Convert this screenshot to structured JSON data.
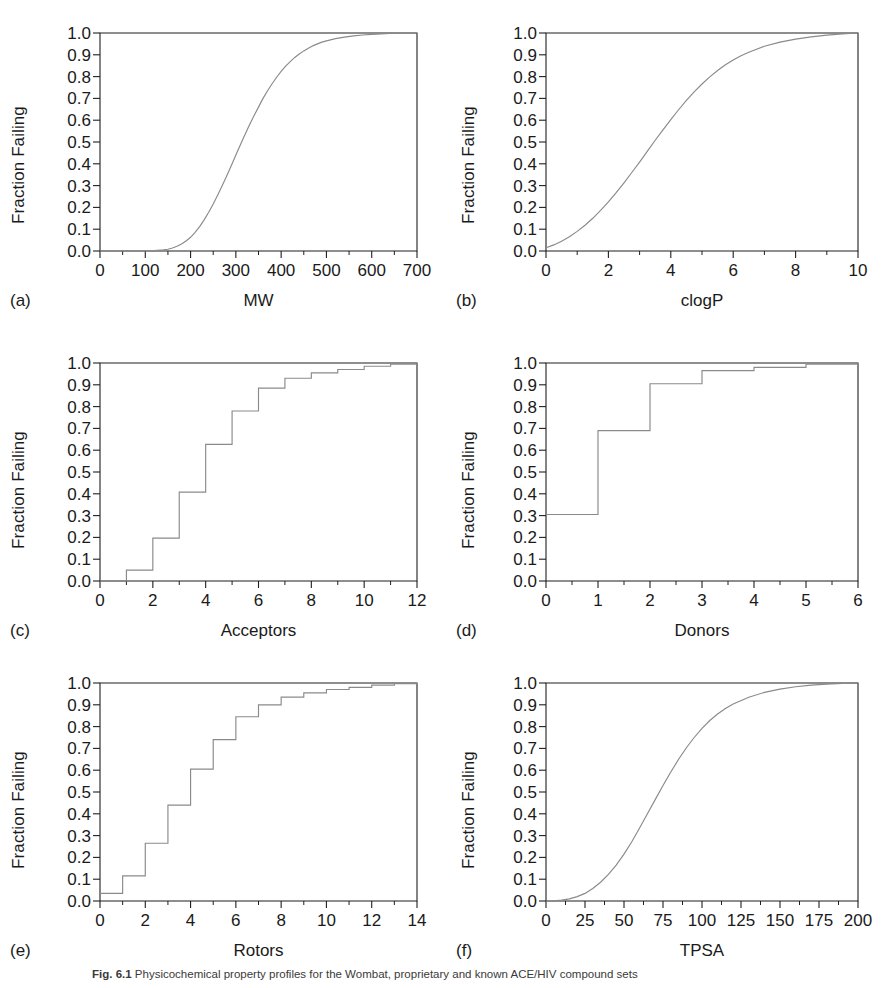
{
  "figure": {
    "ylabel": "Fraction Failing",
    "yticks": [
      "0.0",
      "0.1",
      "0.2",
      "0.3",
      "0.4",
      "0.5",
      "0.6",
      "0.7",
      "0.8",
      "0.9",
      "1.0"
    ],
    "caption_label": "Fig. 6.1",
    "caption_text": "Physicochemical property profiles for the Wombat, proprietary and known ACE/HIV compound sets"
  },
  "chart_data": [
    {
      "type": "line",
      "panel": "a",
      "panel_label": "(a)",
      "title": "",
      "xlabel": "MW",
      "ylabel": "Fraction Failing",
      "xlim": [
        0,
        700
      ],
      "ylim": [
        0,
        1
      ],
      "xticks": [
        0,
        100,
        200,
        300,
        400,
        500,
        600,
        700
      ],
      "xticklabels": [
        "0",
        "100",
        "200",
        "300",
        "400",
        "500",
        "600",
        "700"
      ],
      "yticks": [
        0.0,
        0.1,
        0.2,
        0.3,
        0.4,
        0.5,
        0.6,
        0.7,
        0.8,
        0.9,
        1.0
      ],
      "minor_x_step": 50,
      "grid": false,
      "legend": "none",
      "x": [
        0,
        20,
        40,
        60,
        80,
        100,
        120,
        140,
        150,
        160,
        170,
        180,
        190,
        200,
        210,
        220,
        230,
        240,
        250,
        260,
        270,
        280,
        290,
        300,
        310,
        320,
        330,
        340,
        350,
        360,
        370,
        380,
        390,
        400,
        410,
        420,
        430,
        440,
        450,
        460,
        470,
        480,
        490,
        500,
        520,
        540,
        560,
        580,
        600,
        620,
        640,
        660,
        680,
        700
      ],
      "values": [
        0.0,
        0.0,
        0.0,
        0.0,
        0.0,
        0.0,
        0.002,
        0.005,
        0.008,
        0.014,
        0.022,
        0.032,
        0.046,
        0.063,
        0.085,
        0.112,
        0.143,
        0.178,
        0.216,
        0.257,
        0.3,
        0.345,
        0.392,
        0.44,
        0.487,
        0.533,
        0.578,
        0.62,
        0.66,
        0.7,
        0.735,
        0.767,
        0.797,
        0.824,
        0.848,
        0.869,
        0.888,
        0.904,
        0.918,
        0.93,
        0.941,
        0.95,
        0.958,
        0.964,
        0.974,
        0.981,
        0.987,
        0.991,
        0.994,
        0.996,
        0.998,
        0.999,
        1.0,
        1.0
      ]
    },
    {
      "type": "line",
      "panel": "b",
      "panel_label": "(b)",
      "title": "",
      "xlabel": "clogP",
      "ylabel": "Fraction Failing",
      "xlim": [
        0,
        10
      ],
      "ylim": [
        0,
        1
      ],
      "xticks": [
        0,
        2,
        4,
        6,
        8,
        10
      ],
      "xticklabels": [
        "0",
        "2",
        "4",
        "6",
        "8",
        "10"
      ],
      "yticks": [
        0.0,
        0.1,
        0.2,
        0.3,
        0.4,
        0.5,
        0.6,
        0.7,
        0.8,
        0.9,
        1.0
      ],
      "minor_x_step": 1,
      "grid": false,
      "legend": "none",
      "x": [
        0,
        0.25,
        0.5,
        0.75,
        1.0,
        1.25,
        1.5,
        1.75,
        2.0,
        2.25,
        2.5,
        2.75,
        3.0,
        3.25,
        3.5,
        3.75,
        4.0,
        4.25,
        4.5,
        4.75,
        5.0,
        5.25,
        5.5,
        5.75,
        6.0,
        6.25,
        6.5,
        7.0,
        7.5,
        8.0,
        8.5,
        9.0,
        9.5,
        10.0
      ],
      "values": [
        0.015,
        0.028,
        0.045,
        0.065,
        0.09,
        0.118,
        0.15,
        0.186,
        0.225,
        0.268,
        0.313,
        0.36,
        0.408,
        0.458,
        0.508,
        0.556,
        0.603,
        0.648,
        0.691,
        0.73,
        0.766,
        0.799,
        0.828,
        0.854,
        0.876,
        0.896,
        0.912,
        0.939,
        0.958,
        0.972,
        0.982,
        0.99,
        0.996,
        1.0
      ]
    },
    {
      "type": "line",
      "panel": "c",
      "panel_label": "(c)",
      "title": "",
      "xlabel": "Acceptors",
      "ylabel": "Fraction Failing",
      "xlim": [
        0,
        12
      ],
      "ylim": [
        0,
        1
      ],
      "xticks": [
        0,
        2,
        4,
        6,
        8,
        10,
        12
      ],
      "xticklabels": [
        "0",
        "2",
        "4",
        "6",
        "8",
        "10",
        "12"
      ],
      "yticks": [
        0.0,
        0.1,
        0.2,
        0.3,
        0.4,
        0.5,
        0.6,
        0.7,
        0.8,
        0.9,
        1.0
      ],
      "minor_x_step": 1,
      "grid": false,
      "legend": "none",
      "step": true,
      "x": [
        0,
        1,
        2,
        3,
        4,
        5,
        6,
        7,
        8,
        9,
        10,
        11,
        12
      ],
      "values": [
        0.0,
        0.05,
        0.197,
        0.408,
        0.627,
        0.78,
        0.885,
        0.93,
        0.955,
        0.97,
        0.985,
        0.995,
        1.0
      ]
    },
    {
      "type": "line",
      "panel": "d",
      "panel_label": "(d)",
      "title": "",
      "xlabel": "Donors",
      "ylabel": "Fraction Failing",
      "xlim": [
        0,
        6
      ],
      "ylim": [
        0,
        1
      ],
      "xticks": [
        0,
        1,
        2,
        3,
        4,
        5,
        6
      ],
      "xticklabels": [
        "0",
        "1",
        "2",
        "3",
        "4",
        "5",
        "6"
      ],
      "yticks": [
        0.0,
        0.1,
        0.2,
        0.3,
        0.4,
        0.5,
        0.6,
        0.7,
        0.8,
        0.9,
        1.0
      ],
      "minor_x_step": 0.5,
      "grid": false,
      "legend": "none",
      "step": true,
      "x": [
        0,
        1,
        2,
        3,
        4,
        5,
        6
      ],
      "values": [
        0.305,
        0.69,
        0.905,
        0.965,
        0.98,
        0.995,
        1.0
      ]
    },
    {
      "type": "line",
      "panel": "e",
      "panel_label": "(e)",
      "title": "",
      "xlabel": "Rotors",
      "ylabel": "Fraction Failing",
      "xlim": [
        0,
        14
      ],
      "ylim": [
        0,
        1
      ],
      "xticks": [
        0,
        2,
        4,
        6,
        8,
        10,
        12,
        14
      ],
      "xticklabels": [
        "0",
        "2",
        "4",
        "6",
        "8",
        "10",
        "12",
        "14"
      ],
      "yticks": [
        0.0,
        0.1,
        0.2,
        0.3,
        0.4,
        0.5,
        0.6,
        0.7,
        0.8,
        0.9,
        1.0
      ],
      "minor_x_step": 1,
      "grid": false,
      "legend": "none",
      "step": true,
      "x": [
        0,
        1,
        2,
        3,
        4,
        5,
        6,
        7,
        8,
        9,
        10,
        11,
        12,
        13,
        14
      ],
      "values": [
        0.035,
        0.115,
        0.265,
        0.44,
        0.605,
        0.74,
        0.845,
        0.9,
        0.935,
        0.955,
        0.97,
        0.98,
        0.99,
        0.997,
        1.0
      ]
    },
    {
      "type": "line",
      "panel": "f",
      "panel_label": "(f)",
      "title": "",
      "xlabel": "TPSA",
      "ylabel": "Fraction Failing",
      "xlim": [
        0,
        200
      ],
      "ylim": [
        0,
        1
      ],
      "xticks": [
        0,
        25,
        50,
        75,
        100,
        125,
        150,
        175,
        200
      ],
      "xticklabels": [
        "0",
        "25",
        "50",
        "75",
        "100",
        "125",
        "150",
        "175",
        "200"
      ],
      "yticks": [
        0.0,
        0.1,
        0.2,
        0.3,
        0.4,
        0.5,
        0.6,
        0.7,
        0.8,
        0.9,
        1.0
      ],
      "minor_x_step": 12.5,
      "grid": false,
      "legend": "none",
      "x": [
        0,
        5,
        10,
        15,
        20,
        25,
        30,
        35,
        40,
        45,
        50,
        55,
        60,
        65,
        70,
        75,
        80,
        85,
        90,
        95,
        100,
        105,
        110,
        115,
        120,
        130,
        140,
        150,
        160,
        170,
        180,
        190,
        200
      ],
      "values": [
        0.0,
        0.001,
        0.004,
        0.01,
        0.02,
        0.035,
        0.057,
        0.086,
        0.122,
        0.165,
        0.215,
        0.272,
        0.335,
        0.4,
        0.465,
        0.53,
        0.592,
        0.65,
        0.703,
        0.75,
        0.792,
        0.828,
        0.858,
        0.883,
        0.904,
        0.935,
        0.957,
        0.972,
        0.983,
        0.99,
        0.995,
        0.998,
        1.0
      ]
    }
  ]
}
